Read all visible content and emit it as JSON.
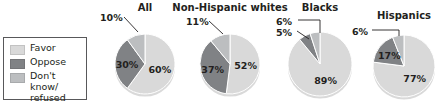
{
  "legend": {
    "items": [
      {
        "label": "Favor",
        "color": "#d9d9d9",
        "key": "favor"
      },
      {
        "label": "Oppose",
        "color": "#808285",
        "key": "oppose"
      },
      {
        "label": "Don't know/\nrefused",
        "color": "#bcbec0",
        "key": "dontknow"
      }
    ]
  },
  "chart_data": {
    "type": "pie",
    "title": "",
    "categories": [
      "Favor",
      "Oppose",
      "Don't know/refused"
    ],
    "colors": [
      "#d9d9d9",
      "#808285",
      "#bcbec0"
    ],
    "legend_position": "left",
    "units": "percent",
    "charts": [
      {
        "title": "All",
        "values": [
          60,
          30,
          10
        ],
        "labels": [
          "60%",
          "30%",
          "10%"
        ],
        "inside": [
          true,
          true,
          false
        ]
      },
      {
        "title": "Non-Hispanic whites",
        "values": [
          52,
          37,
          11
        ],
        "labels": [
          "52%",
          "37%",
          "11%"
        ],
        "inside": [
          true,
          true,
          false
        ]
      },
      {
        "title": "Blacks",
        "values": [
          89,
          6,
          5
        ],
        "labels": [
          "89%",
          "6%",
          "5%"
        ],
        "inside": [
          true,
          false,
          false
        ]
      },
      {
        "title": "Hispanics",
        "values": [
          77,
          17,
          6
        ],
        "labels": [
          "77%",
          "17%",
          "6%"
        ],
        "inside": [
          true,
          true,
          false
        ]
      }
    ]
  }
}
